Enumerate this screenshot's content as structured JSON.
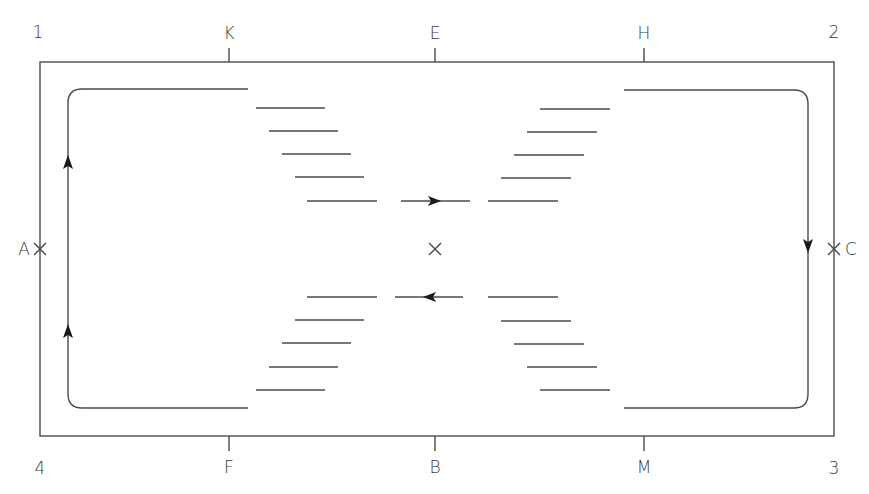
{
  "diagram": {
    "corner_labels": [
      {
        "id": "corner-1",
        "text": "1",
        "x": 38,
        "y": 32
      },
      {
        "id": "corner-2",
        "text": "2",
        "x": 834,
        "y": 32
      },
      {
        "id": "corner-3",
        "text": "3",
        "x": 834,
        "y": 468
      },
      {
        "id": "corner-4",
        "text": "4",
        "x": 40,
        "y": 468
      }
    ],
    "top_labels": [
      {
        "id": "K",
        "text": "K",
        "x": 229,
        "y": 32
      },
      {
        "id": "E",
        "text": "E",
        "x": 435,
        "y": 32
      },
      {
        "id": "H",
        "text": "H",
        "x": 644,
        "y": 32
      }
    ],
    "bottom_labels": [
      {
        "id": "F",
        "text": "F",
        "x": 229,
        "y": 467
      },
      {
        "id": "B",
        "text": "B",
        "x": 435,
        "y": 467
      },
      {
        "id": "M",
        "text": "M",
        "x": 644,
        "y": 467
      }
    ],
    "side_labels": [
      {
        "id": "A",
        "text": "A",
        "x": 24,
        "y": 249
      },
      {
        "id": "C",
        "text": "C",
        "x": 851,
        "y": 249
      }
    ],
    "stroke_color": "#4a4a4a",
    "outer_rect": {
      "x1": 40,
      "y1": 62,
      "x2": 834,
      "y2": 436
    }
  }
}
